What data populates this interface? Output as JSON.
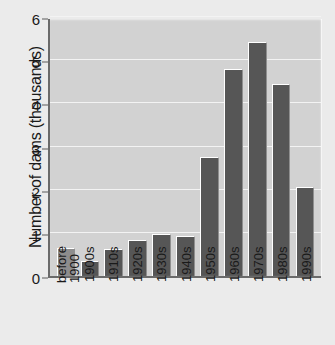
{
  "chart_data": {
    "type": "bar",
    "title": "",
    "xlabel": "",
    "ylabel": "Number of dams (thousands)",
    "categories": [
      "before 1900",
      "1900s",
      "1910s",
      "1920s",
      "1930s",
      "1940s",
      "1950s",
      "1960s",
      "1970s",
      "1980s",
      "1990s"
    ],
    "values": [
      0.64,
      0.35,
      0.62,
      0.83,
      0.97,
      0.93,
      2.75,
      4.79,
      5.42,
      4.44,
      2.07
    ],
    "ylim": [
      0,
      6
    ],
    "yticks": [
      0,
      1,
      2,
      3,
      4,
      5,
      6
    ],
    "ytick_labels": [
      "0",
      "1",
      "2",
      "3",
      "4",
      "5",
      "6"
    ],
    "grid": true,
    "legend": "none",
    "bar_colors": {
      "default": "#565656",
      "highlight": "#8d8d8d"
    },
    "highlight_index": 0,
    "plot_background": "#d2d2d2",
    "figure_background": "#ebebeb",
    "gridline_color": "#f3f3f3",
    "axis_color": "#6a6a6a"
  },
  "axis": {
    "y_title": "Number of dams (thousands)"
  }
}
